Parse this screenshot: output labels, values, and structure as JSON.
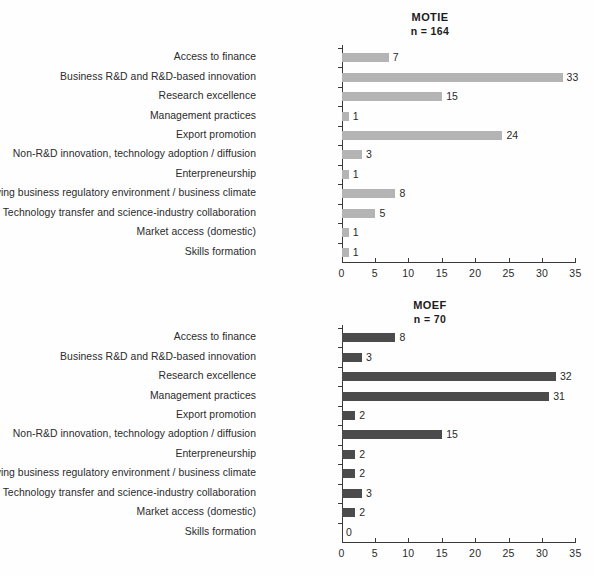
{
  "figure": {
    "background_color": "#fefefe",
    "axis_color": "#3a3a3a",
    "text_color": "#2b2b2b"
  },
  "panels": [
    {
      "id": "motie",
      "title": "MOTIE",
      "subtitle": "n = 164",
      "bar_color": "#b4b4b4",
      "xticks": [
        "0",
        "5",
        "10",
        "15",
        "20",
        "25",
        "30",
        "35"
      ],
      "rows": [
        {
          "label": "Access to finance",
          "value": 7,
          "value_label": "7"
        },
        {
          "label": "Business R&D and R&D-based innovation",
          "value": 33,
          "value_label": "33"
        },
        {
          "label": "Research excellence",
          "value": 15,
          "value_label": "15"
        },
        {
          "label": "Management practices",
          "value": 1,
          "value_label": "1"
        },
        {
          "label": "Export promotion",
          "value": 24,
          "value_label": "24"
        },
        {
          "label": "Non-R&D innovation, technology adoption / diffusion",
          "value": 3,
          "value_label": "3"
        },
        {
          "label": "Enterpreneurship",
          "value": 1,
          "value_label": "1"
        },
        {
          "label": "Improving business regulatory environment / business climate",
          "value": 8,
          "value_label": "8"
        },
        {
          "label": "Technology transfer and science-industry collaboration",
          "value": 5,
          "value_label": "5"
        },
        {
          "label": "Market access (domestic)",
          "value": 1,
          "value_label": "1"
        },
        {
          "label": "Skills formation",
          "value": 1,
          "value_label": "1"
        }
      ]
    },
    {
      "id": "moef",
      "title": "MOEF",
      "subtitle": "n = 70",
      "bar_color": "#4b4b4b",
      "xticks": [
        "0",
        "5",
        "10",
        "15",
        "20",
        "25",
        "30",
        "35"
      ],
      "rows": [
        {
          "label": "Access to finance",
          "value": 8,
          "value_label": "8"
        },
        {
          "label": "Business R&D and R&D-based innovation",
          "value": 3,
          "value_label": "3"
        },
        {
          "label": "Research excellence",
          "value": 32,
          "value_label": "32"
        },
        {
          "label": "Management practices",
          "value": 31,
          "value_label": "31"
        },
        {
          "label": "Export promotion",
          "value": 2,
          "value_label": "2"
        },
        {
          "label": "Non-R&D innovation, technology adoption / diffusion",
          "value": 15,
          "value_label": "15"
        },
        {
          "label": "Enterpreneurship",
          "value": 2,
          "value_label": "2"
        },
        {
          "label": "Improving business regulatory environment / business climate",
          "value": 2,
          "value_label": "2"
        },
        {
          "label": "Technology transfer and science-industry collaboration",
          "value": 3,
          "value_label": "3"
        },
        {
          "label": "Market access (domestic)",
          "value": 2,
          "value_label": "2"
        },
        {
          "label": "Skills formation",
          "value": 0,
          "value_label": "0"
        }
      ]
    }
  ],
  "chart_data": [
    {
      "type": "bar",
      "orientation": "horizontal",
      "title": "MOTIE",
      "subtitle": "n = 164",
      "xlabel": "",
      "ylabel": "",
      "xlim": [
        0,
        35
      ],
      "xticks": [
        0,
        5,
        10,
        15,
        20,
        25,
        30,
        35
      ],
      "grid": false,
      "legend": "none",
      "bar_color": "#b4b4b4",
      "categories": [
        "Access to finance",
        "Business R&D and R&D-based innovation",
        "Research excellence",
        "Management practices",
        "Export promotion",
        "Non-R&D innovation, technology adoption / diffusion",
        "Enterpreneurship",
        "Improving business regulatory environment / business climate",
        "Technology transfer and science-industry collaboration",
        "Market access (domestic)",
        "Skills formation"
      ],
      "values": [
        7,
        33,
        15,
        1,
        24,
        3,
        1,
        8,
        5,
        1,
        1
      ],
      "data_labels": [
        "7",
        "33",
        "15",
        "1",
        "24",
        "3",
        "1",
        "8",
        "5",
        "1",
        "1"
      ]
    },
    {
      "type": "bar",
      "orientation": "horizontal",
      "title": "MOEF",
      "subtitle": "n = 70",
      "xlabel": "",
      "ylabel": "",
      "xlim": [
        0,
        35
      ],
      "xticks": [
        0,
        5,
        10,
        15,
        20,
        25,
        30,
        35
      ],
      "grid": false,
      "legend": "none",
      "bar_color": "#4b4b4b",
      "categories": [
        "Access to finance",
        "Business R&D and R&D-based innovation",
        "Research excellence",
        "Management practices",
        "Export promotion",
        "Non-R&D innovation, technology adoption / diffusion",
        "Enterpreneurship",
        "Improving business regulatory environment / business climate",
        "Technology transfer and science-industry collaboration",
        "Market access (domestic)",
        "Skills formation"
      ],
      "values": [
        8,
        3,
        32,
        31,
        2,
        15,
        2,
        2,
        3,
        2,
        0
      ],
      "data_labels": [
        "8",
        "3",
        "32",
        "31",
        "2",
        "15",
        "2",
        "2",
        "3",
        "2",
        "0"
      ]
    }
  ]
}
